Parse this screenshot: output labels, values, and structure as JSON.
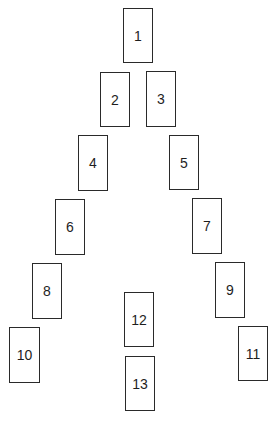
{
  "diagram": {
    "type": "card-spread-layout",
    "cards": [
      {
        "label": "1",
        "x": 123,
        "y": 8,
        "w": 30,
        "h": 55
      },
      {
        "label": "2",
        "x": 100,
        "y": 72,
        "w": 30,
        "h": 55
      },
      {
        "label": "3",
        "x": 146,
        "y": 71,
        "w": 30,
        "h": 56
      },
      {
        "label": "4",
        "x": 78,
        "y": 135,
        "w": 30,
        "h": 56
      },
      {
        "label": "5",
        "x": 169,
        "y": 135,
        "w": 30,
        "h": 55
      },
      {
        "label": "6",
        "x": 55,
        "y": 199,
        "w": 30,
        "h": 56
      },
      {
        "label": "7",
        "x": 192,
        "y": 198,
        "w": 30,
        "h": 56
      },
      {
        "label": "8",
        "x": 32,
        "y": 263,
        "w": 30,
        "h": 56
      },
      {
        "label": "9",
        "x": 215,
        "y": 262,
        "w": 30,
        "h": 56
      },
      {
        "label": "10",
        "x": 9,
        "y": 327,
        "w": 31,
        "h": 56
      },
      {
        "label": "11",
        "x": 238,
        "y": 326,
        "w": 30,
        "h": 55
      },
      {
        "label": "12",
        "x": 124,
        "y": 292,
        "w": 30,
        "h": 55
      },
      {
        "label": "13",
        "x": 125,
        "y": 356,
        "w": 30,
        "h": 55
      }
    ],
    "colors": {
      "border": "#2a2a2a",
      "text": "#1e1e1e",
      "background": "#ffffff"
    }
  }
}
